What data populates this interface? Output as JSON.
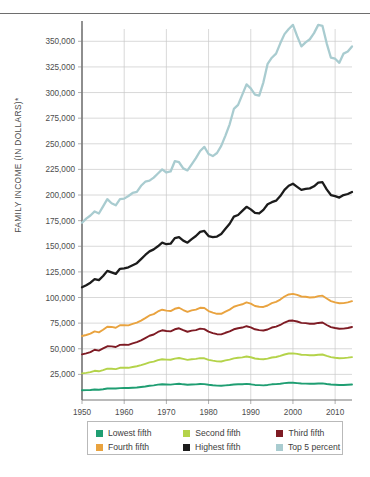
{
  "chart_data": {
    "type": "line",
    "title": "",
    "xlabel": "",
    "ylabel": "FAMILY INCOME (IN DOLLARS)*",
    "xlim": [
      1950,
      2014
    ],
    "ylim": [
      0,
      362000
    ],
    "grid": true,
    "legend_position": "bottom",
    "y_ticks": [
      25000,
      50000,
      75000,
      100000,
      125000,
      150000,
      175000,
      200000,
      225000,
      250000,
      275000,
      300000,
      325000,
      350000
    ],
    "y_tick_labels": [
      "25,000",
      "50,000",
      "75,000",
      "100,000",
      "125,000",
      "150,000",
      "175,000",
      "200,000",
      "225,000",
      "250,000",
      "275,000",
      "300,000",
      "325,000",
      "350,000"
    ],
    "x_ticks": [
      1950,
      1960,
      1970,
      1980,
      1990,
      2000,
      2010
    ],
    "x_tick_labels": [
      "1950",
      "1960",
      "1970",
      "1980",
      "1990",
      "2000",
      "2010"
    ],
    "x": [
      1950,
      1951,
      1952,
      1953,
      1954,
      1955,
      1956,
      1957,
      1958,
      1959,
      1960,
      1961,
      1962,
      1963,
      1964,
      1965,
      1966,
      1967,
      1968,
      1969,
      1970,
      1971,
      1972,
      1973,
      1974,
      1975,
      1976,
      1977,
      1978,
      1979,
      1980,
      1981,
      1982,
      1983,
      1984,
      1985,
      1986,
      1987,
      1988,
      1989,
      1990,
      1991,
      1992,
      1993,
      1994,
      1995,
      1996,
      1997,
      1998,
      1999,
      2000,
      2001,
      2002,
      2003,
      2004,
      2005,
      2006,
      2007,
      2008,
      2009,
      2010,
      2011,
      2012,
      2013,
      2014
    ],
    "series": [
      {
        "name": "Lowest fifth",
        "color": "#1f9e72",
        "values": [
          9500,
          9600,
          9800,
          10200,
          10000,
          10500,
          11200,
          11300,
          11200,
          11600,
          11700,
          11700,
          11900,
          12200,
          12700,
          13200,
          13900,
          14300,
          15000,
          15300,
          15100,
          15000,
          15500,
          15800,
          15300,
          14900,
          15100,
          15200,
          15600,
          15500,
          14900,
          14400,
          14000,
          13900,
          14300,
          14600,
          15100,
          15300,
          15400,
          15700,
          15300,
          14700,
          14500,
          14300,
          14700,
          15300,
          15500,
          15900,
          16500,
          16900,
          16800,
          16500,
          16100,
          16000,
          15900,
          15900,
          16100,
          16200,
          15600,
          15100,
          14900,
          14700,
          14700,
          14900,
          15100
        ]
      },
      {
        "name": "Second fifth",
        "color": "#b4d34a",
        "values": [
          26000,
          26500,
          27200,
          28500,
          28000,
          29200,
          30600,
          30500,
          30100,
          31400,
          31500,
          31400,
          32200,
          32900,
          34000,
          35300,
          36700,
          37400,
          38900,
          39800,
          39400,
          39300,
          40400,
          41000,
          40100,
          39200,
          39800,
          40100,
          40900,
          40700,
          39200,
          38400,
          37700,
          37600,
          38600,
          39400,
          40600,
          41200,
          41600,
          42400,
          41700,
          40500,
          40000,
          39800,
          40400,
          41500,
          42000,
          43000,
          44400,
          45400,
          45500,
          45000,
          44200,
          44000,
          43700,
          43700,
          44200,
          44400,
          43000,
          41800,
          41200,
          40800,
          40900,
          41300,
          41800
        ]
      },
      {
        "name": "Third fifth",
        "color": "#7e1b24",
        "values": [
          44500,
          45500,
          46800,
          49000,
          48200,
          50300,
          52400,
          52300,
          51700,
          53800,
          53900,
          53800,
          55200,
          56400,
          58200,
          60400,
          62700,
          63900,
          66400,
          68000,
          67300,
          67000,
          69000,
          70000,
          68200,
          66600,
          67700,
          68200,
          69600,
          69200,
          66700,
          65300,
          64200,
          64000,
          65600,
          67000,
          69000,
          70000,
          70700,
          72000,
          70900,
          69000,
          68200,
          67800,
          68800,
          70700,
          71600,
          73200,
          75600,
          77300,
          77500,
          76600,
          75300,
          75000,
          74400,
          74400,
          75200,
          75600,
          73200,
          71100,
          70200,
          69500,
          69600,
          70300,
          71200
        ]
      },
      {
        "name": "Fourth fifth",
        "color": "#e9a33f",
        "values": [
          62500,
          63400,
          64800,
          67000,
          66000,
          68500,
          71500,
          71300,
          70500,
          73000,
          73000,
          72800,
          74200,
          75500,
          77500,
          79900,
          82500,
          83800,
          86400,
          88100,
          87200,
          86800,
          89000,
          90000,
          87800,
          86000,
          87400,
          88200,
          90000,
          89700,
          86800,
          85300,
          84100,
          84100,
          86200,
          88200,
          91000,
          92400,
          93400,
          95200,
          94000,
          91700,
          91000,
          90800,
          92200,
          94500,
          95800,
          98000,
          101000,
          103000,
          103500,
          102500,
          101000,
          100700,
          100000,
          100200,
          101300,
          101800,
          99000,
          96500,
          95200,
          94400,
          94500,
          95200,
          96400
        ]
      },
      {
        "name": "Highest fifth",
        "color": "#1c1c1c",
        "values": [
          110000,
          112000,
          114500,
          118000,
          117000,
          121000,
          126000,
          124500,
          123000,
          128000,
          128500,
          129500,
          131500,
          133500,
          137500,
          141500,
          145000,
          147000,
          150000,
          153500,
          152000,
          152500,
          158000,
          159000,
          155500,
          153500,
          157000,
          160000,
          164000,
          165000,
          160000,
          159000,
          159500,
          162000,
          167000,
          172000,
          179000,
          180500,
          184500,
          188500,
          186000,
          182500,
          182000,
          185500,
          191000,
          193000,
          194500,
          199000,
          205000,
          209000,
          211000,
          208000,
          205000,
          206000,
          206500,
          208500,
          212000,
          212500,
          205500,
          200000,
          199000,
          197500,
          200000,
          201000,
          203000
        ]
      },
      {
        "name": "Top 5 percent",
        "color": "#a9ccd0",
        "values": [
          173000,
          177000,
          180000,
          184000,
          182000,
          189000,
          196000,
          192000,
          190000,
          196000,
          196500,
          199000,
          202000,
          203000,
          209000,
          213000,
          214000,
          217000,
          221000,
          225000,
          222000,
          223000,
          233000,
          232000,
          226000,
          224000,
          230000,
          236000,
          243000,
          247000,
          240000,
          238000,
          241000,
          248000,
          258000,
          269000,
          284000,
          288000,
          298000,
          308000,
          304000,
          298000,
          297000,
          310000,
          328000,
          334000,
          338000,
          348000,
          357000,
          362000,
          366000,
          355000,
          345000,
          349000,
          352000,
          358000,
          366000,
          365000,
          348000,
          334000,
          333000,
          329000,
          338000,
          340000,
          345000
        ]
      }
    ]
  },
  "legend": {
    "rows": [
      [
        {
          "label": "Lowest fifth",
          "color": "#1f9e72"
        },
        {
          "label": "Second fifth",
          "color": "#b4d34a"
        },
        {
          "label": "Third fifth",
          "color": "#7e1b24"
        }
      ],
      [
        {
          "label": "Fourth fifth",
          "color": "#e9a33f"
        },
        {
          "label": "Highest fifth",
          "color": "#1c1c1c"
        },
        {
          "label": "Top 5 percent",
          "color": "#a9ccd0"
        }
      ]
    ]
  }
}
